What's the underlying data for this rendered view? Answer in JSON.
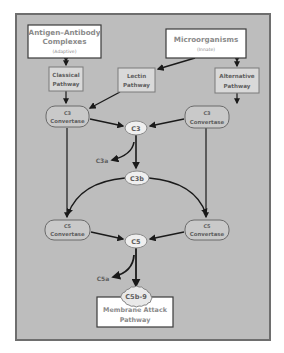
{
  "diagram": {
    "colors": {
      "background": "#bdbdbd",
      "frame_border": "#6e6e6e",
      "box_fill_light": "#ffffff",
      "box_fill_gray": "#d8d8d8",
      "pill_fill": "#c9c9c9",
      "oval_fill": "#efefef",
      "text_light": "#8a8a8a",
      "text_dark": "#5e5e5e",
      "arrow": "#1a1a1a"
    },
    "nodes": {
      "antigen_antibody": {
        "line1": "Antigen–Antibody",
        "line2": "Complexes",
        "sub": "(Adaptive)"
      },
      "microorganisms": {
        "line1": "Microorganisms",
        "sub": "(Innate)"
      },
      "classical": {
        "line1": "Classical",
        "line2": "Pathway"
      },
      "lectin": {
        "line1": "Lectin",
        "line2": "Pathway"
      },
      "alternative": {
        "line1": "Alternative",
        "line2": "Pathway"
      },
      "c3_convertase_left": {
        "line1": "C3",
        "line2": "Convertase"
      },
      "c3_convertase_right": {
        "line1": "C3",
        "line2": "Convertase"
      },
      "c3": {
        "label": "C3"
      },
      "c3a": {
        "label": "C3a"
      },
      "c3b": {
        "label": "C3b"
      },
      "c5_convertase_left": {
        "line1": "C5",
        "line2": "Convertase"
      },
      "c5_convertase_right": {
        "line1": "C5",
        "line2": "Convertase"
      },
      "c5": {
        "label": "C5"
      },
      "c5a": {
        "label": "C5a"
      },
      "c5b9": {
        "label": "C5b-9"
      },
      "membrane_attack": {
        "line1": "Membrane Attack",
        "line2": "Pathway"
      }
    },
    "edges": [
      {
        "from": "antigen_antibody",
        "to": "classical",
        "type": "bidirectional"
      },
      {
        "from": "microorganisms",
        "to": "alternative",
        "type": "bidirectional"
      },
      {
        "from": "microorganisms",
        "to": "lectin"
      },
      {
        "from": "classical",
        "to": "c3_convertase_left"
      },
      {
        "from": "lectin",
        "to": "c3_convertase_left"
      },
      {
        "from": "alternative",
        "to": "c3_convertase_right"
      },
      {
        "from": "c3_convertase_left",
        "to": "c3"
      },
      {
        "from": "c3_convertase_right",
        "to": "c3"
      },
      {
        "from": "c3",
        "to": "c3a"
      },
      {
        "from": "c3",
        "to": "c3b"
      },
      {
        "from": "c3b",
        "to": "c5_convertase_left"
      },
      {
        "from": "c3b",
        "to": "c5_convertase_right"
      },
      {
        "from": "c3_convertase_left",
        "to": "c5_convertase_left"
      },
      {
        "from": "c3_convertase_right",
        "to": "c5_convertase_right"
      },
      {
        "from": "c5_convertase_left",
        "to": "c5"
      },
      {
        "from": "c5_convertase_right",
        "to": "c5"
      },
      {
        "from": "c5",
        "to": "c5a"
      },
      {
        "from": "c5",
        "to": "c5b9"
      }
    ]
  }
}
